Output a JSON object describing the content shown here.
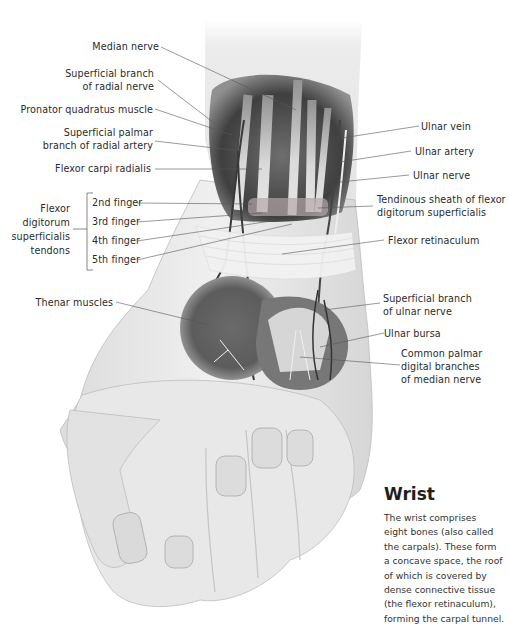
{
  "diagram": {
    "labels_left": [
      {
        "id": "median-nerve",
        "lines": [
          "Median nerve"
        ]
      },
      {
        "id": "superficial-branch-radial-nerve",
        "lines": [
          "Superficial branch",
          "of radial nerve"
        ]
      },
      {
        "id": "pronator-quadratus",
        "lines": [
          "Pronator quadratus muscle"
        ]
      },
      {
        "id": "superficial-palmar-branch-radial-artery",
        "lines": [
          "Superficial palmar",
          "branch of radial artery"
        ]
      },
      {
        "id": "flexor-carpi-radialis",
        "lines": [
          "Flexor carpi radialis"
        ]
      },
      {
        "id": "thenar-muscles",
        "lines": [
          "Thenar muscles"
        ]
      }
    ],
    "group_label": {
      "lines": [
        "Flexor",
        "digitorum",
        "superficialis",
        "tendons"
      ],
      "items": [
        "2nd finger",
        "3rd finger",
        "4th finger",
        "5th finger"
      ]
    },
    "labels_right": [
      {
        "id": "ulnar-vein",
        "lines": [
          "Ulnar vein"
        ]
      },
      {
        "id": "ulnar-artery",
        "lines": [
          "Ulnar artery"
        ]
      },
      {
        "id": "ulnar-nerve",
        "lines": [
          "Ulnar nerve"
        ]
      },
      {
        "id": "tendinous-sheath",
        "lines": [
          "Tendinous sheath of flexor",
          "digitorum superficialis"
        ]
      },
      {
        "id": "flexor-retinaculum",
        "lines": [
          "Flexor retinaculum"
        ]
      },
      {
        "id": "superficial-branch-ulnar-nerve",
        "lines": [
          "Superficial branch",
          "of ulnar nerve"
        ]
      },
      {
        "id": "ulnar-bursa",
        "lines": [
          "Ulnar bursa"
        ]
      },
      {
        "id": "common-palmar-digital",
        "lines": [
          "Common palmar",
          "digital branches",
          "of median nerve"
        ]
      }
    ]
  },
  "sidebar": {
    "title": "Wrist",
    "body_lines": [
      "The wrist comprises",
      "eight bones (also called",
      "the carpals). These form",
      "a concave space, the roof",
      "of which is covered by",
      "dense connective tissue",
      "(the flexor retinaculum),",
      "forming the carpal tunnel."
    ]
  },
  "colors": {
    "background": "#ffffff",
    "text": "#2b2b2b",
    "leader_line": "#555555",
    "skin_light": "#ebebeb",
    "skin_mid": "#d2d2d2",
    "muscle_dark": "#5a5a5a"
  }
}
